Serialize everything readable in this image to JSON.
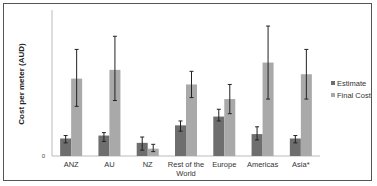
{
  "chart_data": {
    "type": "bar",
    "title": "",
    "xlabel": "",
    "ylabel": "Cost per meter (AUD)",
    "ylim": [
      0,
      100
    ],
    "y_ticks": [
      "0"
    ],
    "grid": false,
    "legend_position": "right",
    "categories": [
      "ANZ",
      "AU",
      "NZ",
      "Rest of the World",
      "Europe",
      "Americas",
      "Asia*"
    ],
    "category_lines": [
      [
        "ANZ"
      ],
      [
        "AU"
      ],
      [
        "NZ"
      ],
      [
        "Rest of the",
        "World"
      ],
      [
        "Europe"
      ],
      [
        "Americas"
      ],
      [
        "Asia*"
      ]
    ],
    "series": [
      {
        "name": "Estimate",
        "color": "#6e6e6e",
        "values": [
          12,
          14,
          9,
          21,
          27,
          15,
          12
        ],
        "error_low": [
          9,
          10,
          4,
          17,
          24,
          11,
          9
        ],
        "error_high": [
          14,
          16,
          13,
          24,
          32,
          20,
          14
        ]
      },
      {
        "name": "Final Cost",
        "color": "#a9a9a9",
        "values": [
          53,
          59,
          5,
          49,
          39,
          64,
          56
        ],
        "error_low": [
          34,
          38,
          3,
          40,
          29,
          39,
          39
        ],
        "error_high": [
          73,
          82,
          8,
          58,
          49,
          89,
          73
        ]
      }
    ]
  }
}
